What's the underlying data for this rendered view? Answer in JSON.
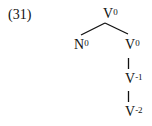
{
  "example_number": "(31)",
  "tree": {
    "root": {
      "base": "V",
      "sup": "0"
    },
    "left": {
      "base": "N",
      "sup": "0"
    },
    "right": {
      "base": "V",
      "sup": "0"
    },
    "chain": [
      {
        "base": "V",
        "sup": "-1"
      },
      {
        "base": "V",
        "sup": "-2"
      }
    ]
  }
}
